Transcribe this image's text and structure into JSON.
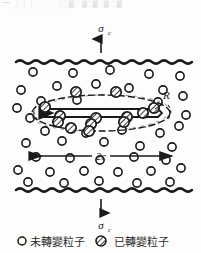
{
  "figure": {
    "stress_top": {
      "symbol": "σ",
      "subscript": "c",
      "name": "applied-stress-top"
    },
    "stress_bottom": {
      "symbol": "σ",
      "subscript": "c",
      "name": "applied-stress-bottom"
    },
    "zone_radius_label": "R",
    "crack_length_label": "2c",
    "colors": {
      "ink": "#1a1a1a",
      "particle_fill": "#ffffff",
      "transformed_fill": "#8c8c8c",
      "paper": "#fdfdfc"
    },
    "legend": {
      "items": [
        {
          "marker": "open-circle",
          "label": "未轉變粒子"
        },
        {
          "marker": "hatched-circle",
          "label": "已轉變粒子"
        }
      ]
    },
    "boundaries": [
      {
        "name": "upper-wavy-boundary",
        "y": 62
      },
      {
        "name": "lower-wavy-boundary",
        "y": 190
      }
    ],
    "untransformed_particles": [
      [
        33,
        72
      ],
      [
        73,
        73
      ],
      [
        110,
        70
      ],
      [
        149,
        74
      ],
      [
        180,
        76
      ],
      [
        21,
        90
      ],
      [
        57,
        86
      ],
      [
        96,
        84
      ],
      [
        129,
        88
      ],
      [
        163,
        90
      ],
      [
        41,
        101
      ],
      [
        77,
        100
      ],
      [
        158,
        102
      ],
      [
        183,
        96
      ],
      [
        30,
        118
      ],
      [
        17,
        108
      ],
      [
        186,
        115
      ],
      [
        45,
        131
      ],
      [
        86,
        133
      ],
      [
        122,
        130
      ],
      [
        160,
        133
      ],
      [
        179,
        126
      ],
      [
        26,
        143
      ],
      [
        62,
        141
      ],
      [
        104,
        142
      ],
      [
        140,
        146
      ],
      [
        172,
        147
      ],
      [
        36,
        157
      ],
      [
        70,
        158
      ],
      [
        100,
        160
      ],
      [
        134,
        157
      ],
      [
        166,
        160
      ],
      [
        18,
        170
      ],
      [
        50,
        172
      ],
      [
        84,
        171
      ],
      [
        118,
        172
      ],
      [
        151,
        171
      ],
      [
        181,
        168
      ],
      [
        28,
        182
      ],
      [
        64,
        183
      ],
      [
        99,
        181
      ],
      [
        137,
        183
      ],
      [
        170,
        182
      ]
    ],
    "transformed_particles": [
      [
        76,
        92
      ],
      [
        116,
        92
      ],
      [
        45,
        107
      ],
      [
        154,
        108
      ],
      [
        60,
        116
      ],
      [
        96,
        118
      ],
      [
        127,
        117
      ],
      [
        143,
        113
      ],
      [
        58,
        122
      ],
      [
        91,
        124
      ],
      [
        124,
        122
      ],
      [
        71,
        128
      ],
      [
        89,
        131
      ]
    ],
    "transformation_zone": {
      "cx": 101,
      "cy": 113,
      "rx": 69,
      "ry": 18,
      "style": "dashed-ellipse"
    },
    "crack": {
      "x1": 38,
      "x2": 160,
      "y": 113,
      "name": "penny-shaped-crack"
    },
    "dimension_line": {
      "x1": 28,
      "x2": 172,
      "y": 156,
      "label": "2c"
    }
  }
}
